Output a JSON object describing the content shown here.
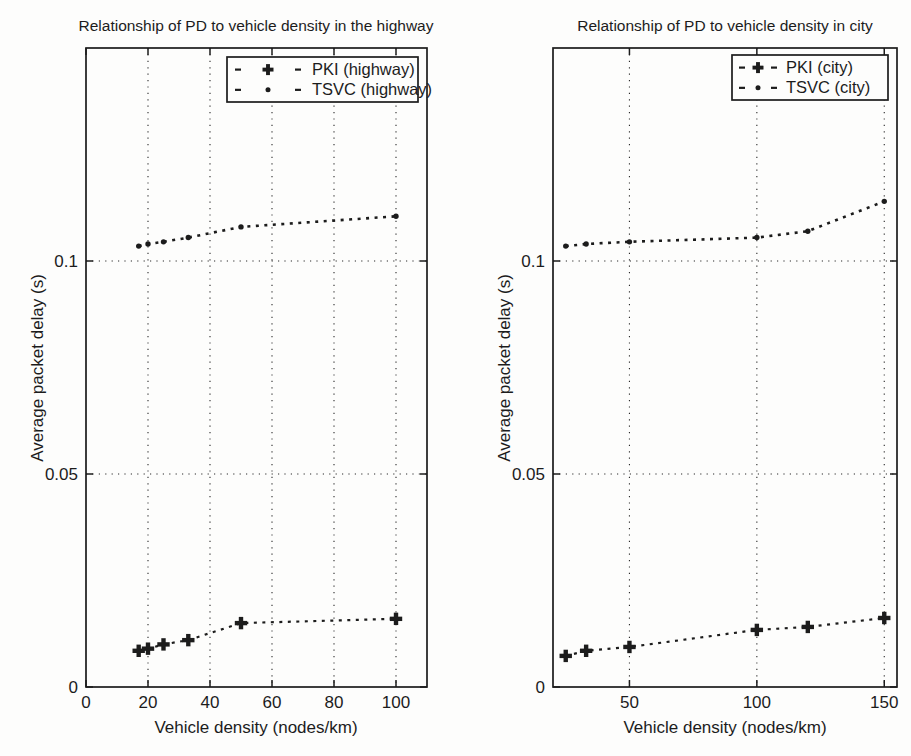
{
  "figure": {
    "background": "#fdfdfc",
    "ink_color": "#1c1c1c"
  },
  "chart_data": [
    {
      "type": "line",
      "title": "Relationship of PD to vehicle density in the highway",
      "xlabel": "Vehicle density (nodes/km)",
      "ylabel": "Average packet delay (s)",
      "xlim": [
        0,
        110
      ],
      "ylim": [
        0,
        0.15
      ],
      "xticks": [
        0,
        20,
        40,
        60,
        80,
        100
      ],
      "yticks": [
        0,
        0.05,
        0.1
      ],
      "grid": "dotted",
      "legend": {
        "position": "top-right",
        "entries": [
          "PKI (highway)",
          "TSVC (highway)"
        ]
      },
      "x": [
        17,
        20,
        25,
        33,
        50,
        100
      ],
      "series": [
        {
          "name": "PKI (highway)",
          "line": "dashed",
          "marker": "bold-plus",
          "values": [
            0.0085,
            0.009,
            0.01,
            0.011,
            0.015,
            0.016
          ]
        },
        {
          "name": "TSVC (highway)",
          "line": "dashed",
          "marker": "dot",
          "values": [
            0.1035,
            0.104,
            0.1045,
            0.1055,
            0.108,
            0.1105
          ]
        }
      ]
    },
    {
      "type": "line",
      "title": "Relationship of PD to vehicle density in city",
      "xlabel": "Vehicle density (nodes/km)",
      "ylabel": "Average packet delay (s)",
      "xlim": [
        20,
        155
      ],
      "ylim": [
        0,
        0.15
      ],
      "xticks": [
        50,
        100,
        150
      ],
      "yticks": [
        0,
        0.05,
        0.1
      ],
      "grid": "dotted",
      "legend": {
        "position": "top-right",
        "entries": [
          "PKI (city)",
          "TSVC (city)"
        ]
      },
      "x": [
        25,
        33,
        50,
        100,
        120,
        150
      ],
      "series": [
        {
          "name": "PKI (city)",
          "line": "dashed",
          "marker": "bold-plus",
          "values": [
            0.0073,
            0.0085,
            0.0094,
            0.0134,
            0.0141,
            0.0162
          ]
        },
        {
          "name": "TSVC (city)",
          "line": "dashed",
          "marker": "dot",
          "values": [
            0.1035,
            0.104,
            0.1045,
            0.1055,
            0.107,
            0.114
          ]
        }
      ]
    }
  ]
}
